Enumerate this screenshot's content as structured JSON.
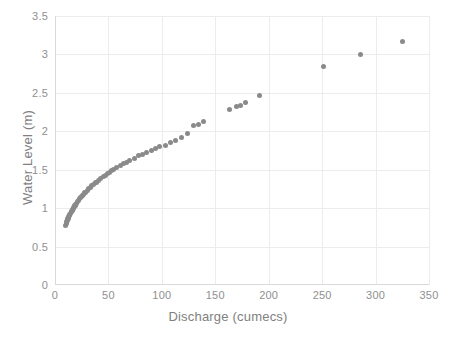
{
  "chart_data": {
    "type": "scatter",
    "title": "",
    "xlabel": "Discharge (cumecs)",
    "ylabel": "Water Level (m)",
    "xlim": [
      0,
      350
    ],
    "ylim": [
      0,
      3.5
    ],
    "xticks": [
      "0",
      "50",
      "100",
      "150",
      "200",
      "250",
      "300",
      "350"
    ],
    "xtick_values": [
      0,
      50,
      100,
      150,
      200,
      250,
      300,
      350
    ],
    "yticks": [
      "0",
      "0.5",
      "1",
      "1.5",
      "2",
      "2.5",
      "3",
      "3.5"
    ],
    "ytick_values": [
      0,
      0.5,
      1,
      1.5,
      2,
      2.5,
      3,
      3.5
    ],
    "grid": true,
    "legend": false,
    "marker_color": "#8a8a8a",
    "gridline_color": "#ececec",
    "tick_label_color": "#8f8f8f",
    "axis_title_color": "#808080",
    "series": [
      {
        "name": "Rating curve",
        "points": [
          [
            10.0,
            0.78
          ],
          [
            10.5,
            0.8
          ],
          [
            11.0,
            0.82
          ],
          [
            11.5,
            0.84
          ],
          [
            12.0,
            0.86
          ],
          [
            12.5,
            0.87
          ],
          [
            13.0,
            0.89
          ],
          [
            13.5,
            0.9
          ],
          [
            14.0,
            0.92
          ],
          [
            14.5,
            0.93
          ],
          [
            15.0,
            0.95
          ],
          [
            15.5,
            0.96
          ],
          [
            16.0,
            0.97
          ],
          [
            16.5,
            0.98
          ],
          [
            17.0,
            1.0
          ],
          [
            17.5,
            1.01
          ],
          [
            18.0,
            1.02
          ],
          [
            18.5,
            1.03
          ],
          [
            19.0,
            1.04
          ],
          [
            19.5,
            1.05
          ],
          [
            20.0,
            1.06
          ],
          [
            21.0,
            1.08
          ],
          [
            22.0,
            1.1
          ],
          [
            23.0,
            1.12
          ],
          [
            24.0,
            1.14
          ],
          [
            25.0,
            1.15
          ],
          [
            26.0,
            1.17
          ],
          [
            27.0,
            1.18
          ],
          [
            28.0,
            1.2
          ],
          [
            29.0,
            1.21
          ],
          [
            30.0,
            1.23
          ],
          [
            31.5,
            1.25
          ],
          [
            33.0,
            1.27
          ],
          [
            34.5,
            1.29
          ],
          [
            36.0,
            1.31
          ],
          [
            37.5,
            1.33
          ],
          [
            39.0,
            1.34
          ],
          [
            41.0,
            1.36
          ],
          [
            43.0,
            1.38
          ],
          [
            45.0,
            1.41
          ],
          [
            47.0,
            1.43
          ],
          [
            49.0,
            1.45
          ],
          [
            51.0,
            1.47
          ],
          [
            53.0,
            1.49
          ],
          [
            55.0,
            1.5
          ],
          [
            58.0,
            1.53
          ],
          [
            61.0,
            1.55
          ],
          [
            64.0,
            1.58
          ],
          [
            67.0,
            1.6
          ],
          [
            70.0,
            1.62
          ],
          [
            74.0,
            1.65
          ],
          [
            78.0,
            1.68
          ],
          [
            82.0,
            1.7
          ],
          [
            86.0,
            1.72
          ],
          [
            90.0,
            1.75
          ],
          [
            94.0,
            1.77
          ],
          [
            98.0,
            1.8
          ],
          [
            103.0,
            1.82
          ],
          [
            108.0,
            1.85
          ],
          [
            113.0,
            1.88
          ],
          [
            118.0,
            1.92
          ],
          [
            124.0,
            1.97
          ],
          [
            130.0,
            2.07
          ],
          [
            134.0,
            2.09
          ],
          [
            139.0,
            2.13
          ],
          [
            163.0,
            2.28
          ],
          [
            170.0,
            2.32
          ],
          [
            174.0,
            2.34
          ],
          [
            178.0,
            2.38
          ],
          [
            191.0,
            2.47
          ],
          [
            251.0,
            2.84
          ],
          [
            286.0,
            3.0
          ],
          [
            325.0,
            3.17
          ]
        ]
      }
    ]
  }
}
